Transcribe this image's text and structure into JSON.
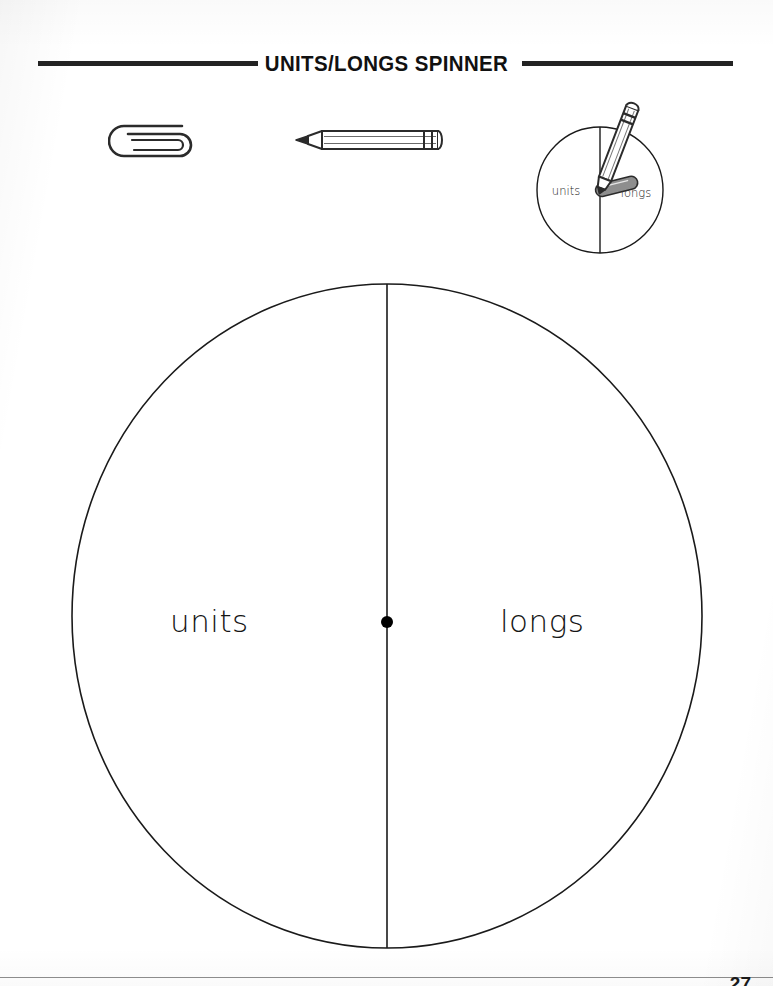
{
  "worksheet": {
    "title": "UNITS/LONGS SPINNER",
    "page_number": "27"
  },
  "materials": {
    "paperclip_icon": "paperclip-icon",
    "pencil_icon": "pencil-icon"
  },
  "demo_spinner": {
    "left_label": "units",
    "right_label": "longs",
    "pencil_icon": "pencil-icon",
    "paperclip_icon": "paperclip-icon"
  },
  "main_spinner": {
    "left_label": "units",
    "right_label": "longs",
    "center_pivot": "center-dot"
  },
  "colors": {
    "ink": "#000000",
    "rule": "#232323",
    "paper": "#ffffff",
    "metal_gray": "#8a8a8a",
    "footer_rule": "#8e8e8e"
  }
}
